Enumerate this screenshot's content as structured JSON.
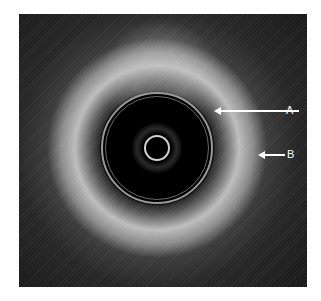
{
  "figure": {
    "type": "intravascular/endoscopic ultrasound cross-section",
    "annotations": [
      {
        "id": "A",
        "label": "A"
      },
      {
        "id": "B",
        "label": "B"
      }
    ],
    "colors": {
      "background": "#ffffff",
      "scan": "#1a1a1a",
      "annotation": "#ffffff"
    }
  }
}
